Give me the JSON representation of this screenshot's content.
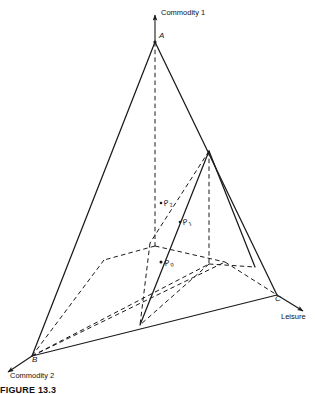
{
  "figure": {
    "caption": "FIGURE 13.3",
    "type": "3d-axis-diagram",
    "background": "#ffffff",
    "line_color": "#1a1a1a"
  },
  "axes": [
    {
      "id": "commodity1",
      "label": "Commodity 1",
      "direction": "up",
      "arrow_tip": [
        155,
        12
      ],
      "origin_vertex": "A"
    },
    {
      "id": "commodity2",
      "label": "Commodity 2",
      "direction": "down-left",
      "arrow_tip": [
        5,
        374
      ],
      "origin_vertex": "B"
    },
    {
      "id": "leisure",
      "label": "Leisure",
      "direction": "down-right",
      "arrow_tip": [
        306,
        313
      ],
      "origin_vertex": "C"
    }
  ],
  "vertices": [
    {
      "id": "A",
      "label": "A",
      "x": 155,
      "y": 42
    },
    {
      "id": "B",
      "label": "B",
      "x": 32,
      "y": 356
    },
    {
      "id": "C",
      "label": "C",
      "x": 277,
      "y": 295
    }
  ],
  "points": [
    {
      "id": "P0",
      "label": "P",
      "sub": "0",
      "x": 163,
      "y": 258,
      "marker": true
    },
    {
      "id": "P1",
      "label": "P",
      "sub": "1",
      "x": 183,
      "y": 220,
      "marker": true
    },
    {
      "id": "P2",
      "label": "P",
      "sub": "2",
      "x": 165,
      "y": 201,
      "marker": true
    }
  ],
  "inner_triangle": {
    "apex": [
      209,
      151
    ],
    "base": [
      140,
      325
    ],
    "note": "secondary budget plane"
  }
}
